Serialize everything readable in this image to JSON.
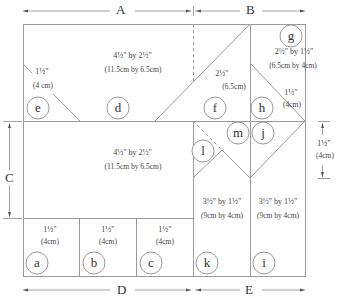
{
  "dimensions": {
    "A": "A",
    "B": "B",
    "C": "C",
    "D": "D",
    "E": "E"
  },
  "pieces": {
    "top_left": {
      "size": "4½\" by 2½\"",
      "metric": "(11.5cm by 6.5cm)"
    },
    "e_side": {
      "size": "1½\"",
      "metric": "(4 cm)"
    },
    "f_side": {
      "size": "2½\"",
      "metric": "(6.5cm)"
    },
    "g": {
      "size": "2½\" by 1½\"",
      "metric": "(6.5cm by 4cm)"
    },
    "h_side": {
      "size": "1½\"",
      "metric": "(4cm)"
    },
    "middle_left": {
      "size": "4½\" by 2½\"",
      "metric": "(11.5cm by 6.5cm)"
    },
    "right_dim": {
      "size": "1½\"",
      "metric": "(4cm)"
    },
    "k": {
      "size": "3½\" by 1½\"",
      "metric": "(9cm by 4cm)"
    },
    "i": {
      "size": "3½\" by 1½\"",
      "metric": "(9cm by 4cm)"
    },
    "a": {
      "size": "1½\"",
      "metric": "(4cm)"
    },
    "b": {
      "size": "1½\"",
      "metric": "(4cm)"
    },
    "c": {
      "size": "1½\"",
      "metric": "(4cm)"
    }
  },
  "letters": [
    "a",
    "b",
    "c",
    "d",
    "e",
    "f",
    "g",
    "h",
    "i",
    "j",
    "k",
    "l",
    "m"
  ]
}
